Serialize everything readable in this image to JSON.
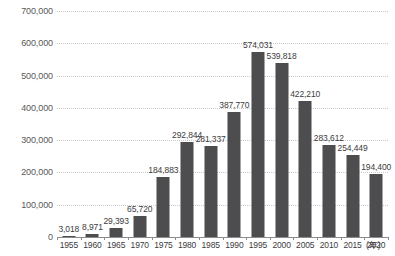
{
  "chart_data": {
    "type": "bar",
    "title": "",
    "subtitle": "",
    "xlabel": "(年)",
    "ylabel": "",
    "categories": [
      "1955",
      "1960",
      "1965",
      "1970",
      "1975",
      "1980",
      "1985",
      "1990",
      "1995",
      "2000",
      "2005",
      "2010",
      "2015",
      "2020"
    ],
    "values": [
      3018,
      8971,
      29393,
      65720,
      184883,
      292844,
      281337,
      387770,
      574031,
      539818,
      422210,
      283612,
      254449,
      194400
    ],
    "value_labels": [
      "3,018",
      "8,971",
      "29,393",
      "65,720",
      "184,883",
      "292,844",
      "281,337",
      "387,770",
      "574,031",
      "539,818",
      "422,210",
      "283,612",
      "254,449",
      "194,400"
    ],
    "ylim": [
      0,
      700000
    ],
    "ytick_values": [
      0,
      100000,
      200000,
      300000,
      400000,
      500000,
      600000,
      700000
    ],
    "ytick_labels": [
      "0",
      "100,000",
      "200,000",
      "300,000",
      "400,000",
      "500,000",
      "600,000",
      "700,000"
    ],
    "grid": true,
    "grid_style": "dotted",
    "legend": null,
    "bar_color": "#4d4d4f",
    "grid_color": "#c9c9c9",
    "axis_color": "#8c8c8e",
    "text_color": "#3c3c3e",
    "background_color": "#ffffff"
  }
}
